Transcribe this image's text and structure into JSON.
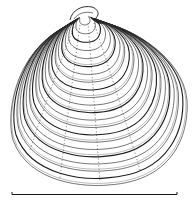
{
  "figure": {
    "subject": "Bivalve shell illustration",
    "colors": {
      "background": "#ffffff",
      "ink": "#1a1a1a",
      "ink_light": "#555555"
    },
    "scale_bar": {
      "x1": 12,
      "x2": 177,
      "y": 194,
      "label": ""
    },
    "shell": {
      "umbo": {
        "x": 84,
        "y": 11
      },
      "concentric_rings": 22
    }
  }
}
